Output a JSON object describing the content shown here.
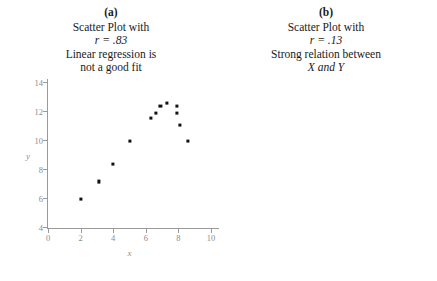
{
  "figure": {
    "panels": [
      {
        "letter": "(a)",
        "caption_lines": [
          "Scatter Plot with",
          "r = .83",
          "Linear regression is",
          "not a good fit"
        ]
      },
      {
        "letter": "(b)",
        "caption_lines": [
          "Scatter Plot with",
          "r = .13",
          "Strong relation between",
          "X and Y"
        ]
      }
    ]
  },
  "chart_data": [
    {
      "type": "scatter",
      "title": "Scatter Plot with r = .83 — Linear regression is not a good fit",
      "panel": "(a)",
      "correlation": 0.83,
      "xlabel": "x",
      "ylabel": "y",
      "xlim": [
        0,
        10
      ],
      "ylim": [
        4,
        14
      ],
      "xticks": [
        0,
        2,
        4,
        6,
        8,
        10
      ],
      "yticks": [
        4,
        6,
        8,
        10,
        12,
        14
      ],
      "grid": false,
      "legend": "none",
      "points": [
        {
          "x": 2.0,
          "y": 6.0
        },
        {
          "x": 3.1,
          "y": 7.2
        },
        {
          "x": 4.0,
          "y": 8.4
        },
        {
          "x": 5.0,
          "y": 10.0
        },
        {
          "x": 6.3,
          "y": 11.6
        },
        {
          "x": 6.6,
          "y": 11.9
        },
        {
          "x": 6.9,
          "y": 12.4
        },
        {
          "x": 7.3,
          "y": 12.6
        },
        {
          "x": 7.9,
          "y": 12.4
        },
        {
          "x": 7.9,
          "y": 11.9
        },
        {
          "x": 8.1,
          "y": 11.1
        },
        {
          "x": 8.6,
          "y": 10.0
        }
      ]
    },
    {
      "type": "scatter",
      "title": "Scatter Plot with r = .13 — Strong relation between X and Y",
      "panel": "(b)",
      "correlation": 0.13,
      "xlabel": "x",
      "ylabel": "y",
      "xlim": [
        0,
        15
      ],
      "ylim": [
        0,
        15
      ],
      "xticks": [
        0,
        5,
        10,
        15
      ],
      "yticks": [
        0,
        5,
        10,
        15
      ],
      "grid": false,
      "legend": "none",
      "points": [
        {
          "x": 2.3,
          "y": 3.1
        },
        {
          "x": 2.5,
          "y": 5.4
        },
        {
          "x": 3.0,
          "y": 8.1
        },
        {
          "x": 4.2,
          "y": 10.7
        },
        {
          "x": 5.2,
          "y": 13.8
        },
        {
          "x": 6.6,
          "y": 14.3
        },
        {
          "x": 7.0,
          "y": 13.6
        },
        {
          "x": 8.0,
          "y": 11.4
        },
        {
          "x": 8.9,
          "y": 8.0
        },
        {
          "x": 9.6,
          "y": 6.6
        },
        {
          "x": 10.2,
          "y": 5.8
        }
      ]
    }
  ]
}
